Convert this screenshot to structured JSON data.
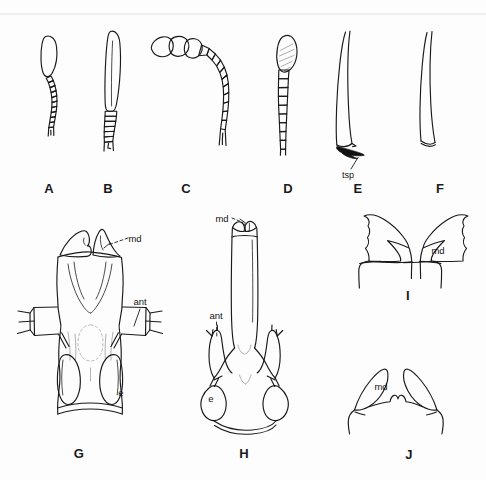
{
  "figure": {
    "kind": "scientific-illustration-plate",
    "background_color": "#fdfdfd",
    "ink_color": "#1a1a1a",
    "panel_count": 10
  },
  "panels": [
    {
      "letter": "A",
      "label_x": 49,
      "label_y": 188,
      "subject": "clubbed antenna with short segmented flagellum",
      "annotations": []
    },
    {
      "letter": "B",
      "label_x": 108,
      "label_y": 188,
      "subject": "elongate clubbed antenna with long scape",
      "annotations": []
    },
    {
      "letter": "C",
      "label_x": 186,
      "label_y": 188,
      "subject": "geniculate antenna with three-segmented club",
      "annotations": []
    },
    {
      "letter": "D",
      "label_x": 288,
      "label_y": 188,
      "subject": "antenna with hatched terminal segment",
      "annotations": []
    },
    {
      "letter": "E",
      "label_x": 358,
      "label_y": 188,
      "subject": "tibia with tibial spur",
      "annotations": [
        {
          "text": "tsp",
          "x": 348,
          "y": 175
        }
      ]
    },
    {
      "letter": "F",
      "label_x": 440,
      "label_y": 188,
      "subject": "tibia without tibial spur",
      "annotations": []
    },
    {
      "letter": "G",
      "label_x": 79,
      "label_y": 453,
      "subject": "head capsule, dorsal view",
      "annotations": [
        {
          "text": "md",
          "x": 135,
          "y": 238
        },
        {
          "text": "ant",
          "x": 140,
          "y": 301
        },
        {
          "text": "e",
          "x": 121,
          "y": 392
        }
      ]
    },
    {
      "letter": "H",
      "label_x": 244,
      "label_y": 453,
      "subject": "head capsule with elongate rostrum, dorsal view",
      "annotations": [
        {
          "text": "md",
          "x": 222,
          "y": 218
        },
        {
          "text": "ant",
          "x": 216,
          "y": 315
        },
        {
          "text": "e",
          "x": 211,
          "y": 398
        }
      ]
    },
    {
      "letter": "I",
      "label_x": 408,
      "label_y": 295,
      "subject": "paired mandibles, frontal view",
      "annotations": [
        {
          "text": "md",
          "x": 438,
          "y": 250
        }
      ]
    },
    {
      "letter": "J",
      "label_x": 409,
      "label_y": 454,
      "subject": "paired falcate mandibles, frontal view",
      "annotations": [
        {
          "text": "md",
          "x": 381,
          "y": 386
        }
      ]
    }
  ],
  "legend_abbreviations": [
    {
      "key": "md",
      "meaning": "mandible"
    },
    {
      "key": "ant",
      "meaning": "antenna"
    },
    {
      "key": "e",
      "meaning": "eye"
    },
    {
      "key": "tsp",
      "meaning": "tibial spur"
    }
  ]
}
